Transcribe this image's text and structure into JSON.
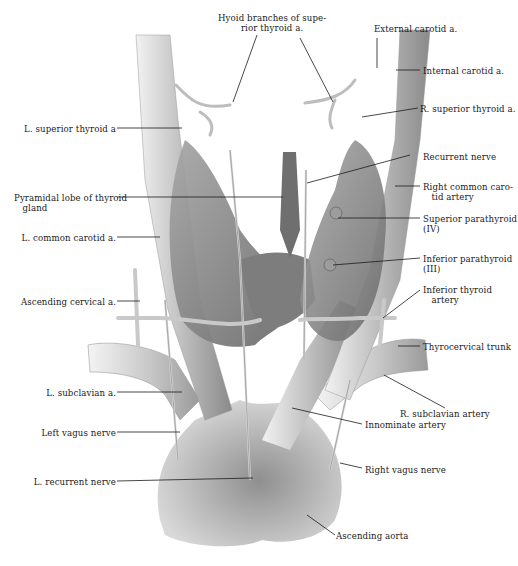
{
  "figure": {
    "labels": {
      "hyoid_branches": "Hyoid branches of supe-\nrior thyroid a.",
      "external_carotid": "External carotid a.",
      "internal_carotid": "Internal carotid a.",
      "r_superior_thyroid": "R. superior thyroid a.",
      "l_superior_thyroid": "L. superior thyroid a",
      "recurrent_nerve": "Recurrent nerve",
      "right_common_carotid": "Right common caro-\n   tid artery",
      "pyramidal_lobe": "Pyramidal lobe of thyroid\n   gland",
      "superior_parathyroid": "Superior parathyroid\n(IV)",
      "l_common_carotid": "L. common carotid a.",
      "inferior_parathyroid": "Inferior parathyroid\n(III)",
      "ascending_cervical": "Ascending cervical a.",
      "inferior_thyroid": "Inferior thyroid\n   artery",
      "thyrocervical_trunk": "Thyrocervical trunk",
      "l_subclavian": "L. subclavian a.",
      "r_subclavian": "R. subclavian artery",
      "innominate": "Innominate artery",
      "left_vagus": "Left vagus nerve",
      "right_vagus": "Right vagus nerve",
      "l_recurrent": "L. recurrent nerve",
      "ascending_aorta": "Ascending aorta"
    },
    "colors": {
      "ink": "#1a1a1a",
      "vessel_light": "#e6e6e6",
      "vessel_mid": "#a8a8a8",
      "gland": "#8c8c8c",
      "gland_dark": "#5e5e5e"
    }
  }
}
